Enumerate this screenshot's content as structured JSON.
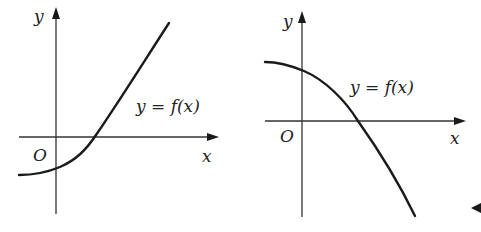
{
  "figures": [
    {
      "id": "left",
      "y_axis_label": "y",
      "x_axis_label": "x",
      "origin_label": "O",
      "curve_label": "y = f(x)",
      "description": "Increasing concave-up curve crossing the y-axis below the origin and the x-axis to the right of the origin"
    },
    {
      "id": "right",
      "y_axis_label": "y",
      "x_axis_label": "x",
      "origin_label": "O",
      "curve_label": "y = f(x)",
      "description": "Decreasing concave-down curve crossing the y-axis above the origin and the x-axis to the right of the origin"
    }
  ],
  "colors": {
    "background": "#ffffff",
    "ink": "#1a1a1a"
  }
}
